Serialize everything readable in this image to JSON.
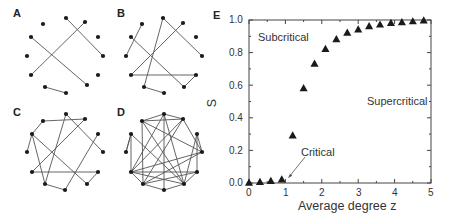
{
  "panels": {
    "A": {
      "label": "A",
      "nodes": [
        [
          43,
          24
        ],
        [
          66,
          18
        ],
        [
          85,
          22
        ],
        [
          31,
          37
        ],
        [
          98,
          37
        ],
        [
          27,
          56
        ],
        [
          103,
          56
        ],
        [
          31,
          75
        ],
        [
          98,
          75
        ],
        [
          45,
          87
        ],
        [
          66,
          93
        ],
        [
          87,
          85
        ]
      ],
      "edges": [
        [
          1,
          6
        ],
        [
          2,
          7
        ],
        [
          3,
          11
        ],
        [
          9,
          10
        ]
      ]
    },
    "B": {
      "label": "B",
      "nodes": [
        [
          142,
          24
        ],
        [
          163,
          18
        ],
        [
          183,
          23
        ],
        [
          131,
          37
        ],
        [
          196,
          37
        ],
        [
          126,
          56
        ],
        [
          202,
          56
        ],
        [
          131,
          75
        ],
        [
          196,
          75
        ],
        [
          144,
          87
        ],
        [
          164,
          93
        ],
        [
          184,
          87
        ]
      ],
      "edges": [
        [
          0,
          5
        ],
        [
          1,
          6
        ],
        [
          1,
          9
        ],
        [
          2,
          7
        ],
        [
          3,
          11
        ],
        [
          7,
          8
        ],
        [
          8,
          11
        ],
        [
          9,
          10
        ]
      ]
    },
    "C": {
      "label": "C",
      "nodes": [
        [
          43,
          121
        ],
        [
          66,
          114
        ],
        [
          85,
          119
        ],
        [
          32,
          134
        ],
        [
          98,
          134
        ],
        [
          27,
          152
        ],
        [
          103,
          152
        ],
        [
          32,
          172
        ],
        [
          98,
          172
        ],
        [
          45,
          184
        ],
        [
          65,
          190
        ],
        [
          87,
          184
        ]
      ],
      "edges": [
        [
          0,
          2
        ],
        [
          0,
          3
        ],
        [
          1,
          6
        ],
        [
          1,
          9
        ],
        [
          2,
          7
        ],
        [
          3,
          5
        ],
        [
          3,
          9
        ],
        [
          3,
          11
        ],
        [
          4,
          10
        ],
        [
          7,
          8
        ],
        [
          8,
          11
        ],
        [
          9,
          10
        ]
      ]
    },
    "D": {
      "label": "D",
      "nodes": [
        [
          142,
          121
        ],
        [
          164,
          114
        ],
        [
          183,
          119
        ],
        [
          131,
          134
        ],
        [
          197,
          134
        ],
        [
          126,
          152
        ],
        [
          202,
          152
        ],
        [
          131,
          172
        ],
        [
          197,
          172
        ],
        [
          143,
          184
        ],
        [
          164,
          190
        ],
        [
          184,
          184
        ]
      ],
      "edges": [
        [
          0,
          1
        ],
        [
          0,
          2
        ],
        [
          0,
          6
        ],
        [
          0,
          9
        ],
        [
          0,
          11
        ],
        [
          1,
          2
        ],
        [
          1,
          7
        ],
        [
          1,
          10
        ],
        [
          1,
          11
        ],
        [
          2,
          6
        ],
        [
          2,
          9
        ],
        [
          3,
          5
        ],
        [
          3,
          7
        ],
        [
          3,
          11
        ],
        [
          4,
          6
        ],
        [
          4,
          8
        ],
        [
          4,
          11
        ],
        [
          6,
          7
        ],
        [
          6,
          9
        ],
        [
          7,
          8
        ],
        [
          7,
          9
        ],
        [
          7,
          11
        ],
        [
          8,
          9
        ],
        [
          8,
          11
        ],
        [
          9,
          10
        ],
        [
          10,
          11
        ],
        [
          2,
          7
        ],
        [
          5,
          3
        ]
      ]
    }
  },
  "chart_data": {
    "type": "scatter",
    "panel_label": "E",
    "title": "",
    "xlabel": "Average degree z",
    "ylabel": "S",
    "xlim": [
      0,
      5
    ],
    "ylim": [
      0,
      1.0
    ],
    "xticks": [
      "0",
      "1",
      "2",
      "3",
      "4",
      "5"
    ],
    "yticks": [
      "0.0",
      "0.2",
      "0.4",
      "0.6",
      "0.8",
      "1.0"
    ],
    "grid": false,
    "marker": "triangle",
    "series": [
      {
        "name": "S",
        "x": [
          0.0,
          0.3,
          0.6,
          0.9,
          1.2,
          1.5,
          1.8,
          2.1,
          2.4,
          2.7,
          3.0,
          3.3,
          3.6,
          3.9,
          4.2,
          4.5,
          4.8
        ],
        "values": [
          0.0,
          0.005,
          0.01,
          0.02,
          0.29,
          0.58,
          0.73,
          0.82,
          0.88,
          0.92,
          0.94,
          0.96,
          0.97,
          0.98,
          0.985,
          0.99,
          0.995
        ]
      }
    ],
    "annotations": [
      {
        "text": "Subcritical",
        "x": 0.25,
        "y": 0.9
      },
      {
        "text": "Supercritical",
        "x": 3.3,
        "y": 0.43
      },
      {
        "text": "Critical",
        "x": 1.4,
        "y": 0.18,
        "arrow_to": [
          1.0,
          0.01
        ]
      }
    ]
  },
  "labels": {
    "A": "A",
    "B": "B",
    "C": "C",
    "D": "D",
    "E": "E",
    "ylabel": "S",
    "xlabel": "Average degree z",
    "subcritical": "Subcritical",
    "supercritical": "Supercritical",
    "critical": "Critical",
    "xtick_0": "0",
    "xtick_1": "1",
    "xtick_2": "2",
    "xtick_3": "3",
    "xtick_4": "4",
    "xtick_5": "5",
    "ytick_0": "0.0",
    "ytick_1": "0.2",
    "ytick_2": "0.4",
    "ytick_3": "0.6",
    "ytick_4": "0.8",
    "ytick_5": "1.0"
  }
}
